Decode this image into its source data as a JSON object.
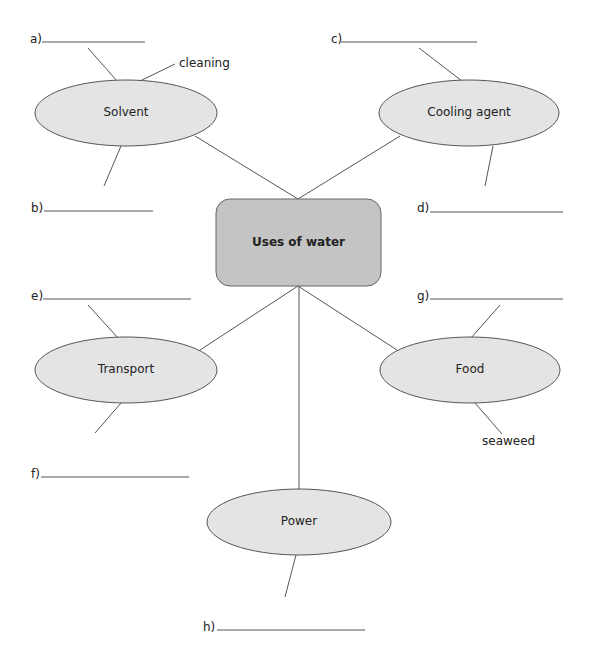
{
  "diagram": {
    "title": "Uses of water",
    "center": {
      "label": "Uses of water",
      "fill": "#c4c4c4"
    },
    "nodes": [
      {
        "id": "solvent",
        "label": "Solvent"
      },
      {
        "id": "cooling",
        "label": "Cooling agent"
      },
      {
        "id": "transport",
        "label": "Transport"
      },
      {
        "id": "food",
        "label": "Food"
      },
      {
        "id": "power",
        "label": "Power"
      }
    ],
    "node_fill": "#e4e4e4",
    "answers": [
      {
        "letter": "a)",
        "value": ""
      },
      {
        "letter": "b)",
        "value": ""
      },
      {
        "letter": "c)",
        "value": ""
      },
      {
        "letter": "d)",
        "value": ""
      },
      {
        "letter": "e)",
        "value": ""
      },
      {
        "letter": "f)",
        "value": ""
      },
      {
        "letter": "g)",
        "value": ""
      },
      {
        "letter": "h)",
        "value": ""
      }
    ],
    "examples": [
      {
        "node": "solvent",
        "text": "cleaning"
      },
      {
        "node": "food",
        "text": "seaweed"
      }
    ]
  }
}
